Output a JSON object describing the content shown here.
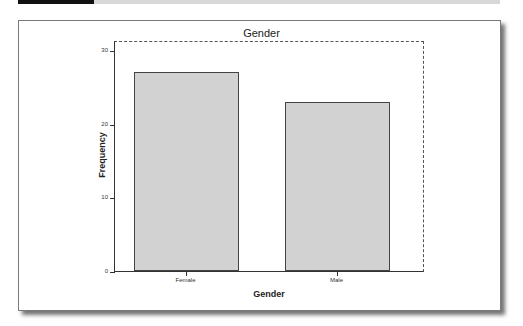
{
  "chart_data": {
    "type": "bar",
    "title": "Gender",
    "categories": [
      "Female",
      "Male"
    ],
    "values": [
      27,
      23
    ],
    "xlabel": "Gender",
    "ylabel": "Frequency",
    "ylim": [
      0,
      30
    ],
    "yticks": [
      "0",
      "10",
      "20",
      "30"
    ],
    "grid": false,
    "legend": null,
    "bar_color": "#d2d2d2"
  }
}
